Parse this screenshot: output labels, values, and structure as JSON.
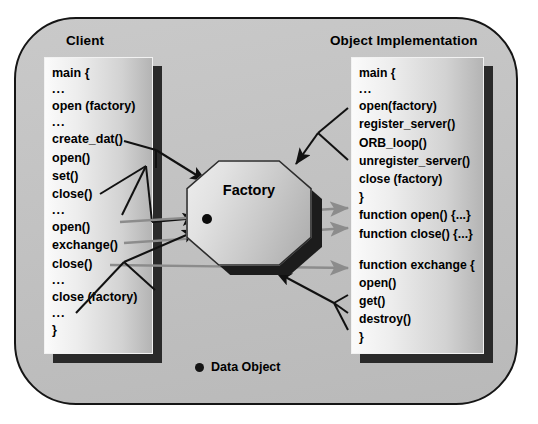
{
  "diagram": {
    "title_client": "Client",
    "title_object_implementation": "Object Implementation",
    "center_node_label": "Factory",
    "legend": {
      "marker": "data-object-dot",
      "label": "Data Object"
    },
    "colors": {
      "panel_background": "#c2c2c2",
      "panel_border": "#151515",
      "code_box_light": "#fbfbfb",
      "code_box_dark": "#b4b4b4",
      "box_shadow": "#2a2a2a",
      "arrow_black": "#111111",
      "arrow_gray": "#8c8c8c",
      "data_object": "#0c0c0c",
      "text": "#000000"
    },
    "client_code": [
      "main {",
      "...",
      "open (factory)",
      "...",
      "create_dat()",
      "open()",
      "set()",
      "close()",
      "...",
      "open()",
      "exchange()",
      "close()",
      "...",
      "close (factory)",
      "...",
      "}"
    ],
    "object_implementation_code": [
      "main {",
      "...",
      "open(factory)",
      "register_server()",
      "ORB_loop()",
      "unregister_server()",
      "close (factory)",
      "}",
      "function open() {...}",
      "function close() {...}",
      "",
      "function exchange {",
      "open()",
      "get()",
      "destroy()",
      "}"
    ]
  }
}
